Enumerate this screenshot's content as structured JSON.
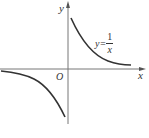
{
  "diagram": {
    "type": "function-graph",
    "function": "y = 1/x",
    "axes": {
      "x_label": "x",
      "y_label": "y",
      "origin_label": "O"
    },
    "curve_label": {
      "lhs": "y=",
      "numerator": "1",
      "denominator": "x"
    },
    "colors": {
      "axis": "#555555",
      "curve": "#333333",
      "text": "#333333"
    }
  }
}
